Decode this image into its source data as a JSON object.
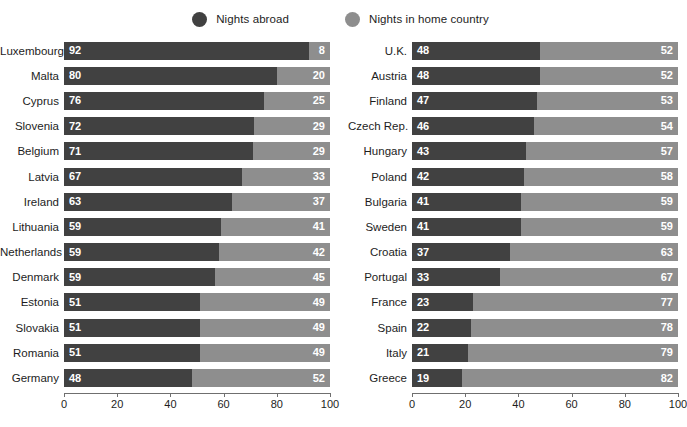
{
  "legend": {
    "items": [
      {
        "label": "Nights abroad",
        "color": "#414141",
        "icon": "legend-dot-icon"
      },
      {
        "label": "Nights in home country",
        "color": "#8e8e8e",
        "icon": "legend-dot-icon"
      }
    ]
  },
  "axis": {
    "ticks": [
      0,
      20,
      40,
      60,
      80,
      100
    ],
    "min": 0,
    "max": 100
  },
  "chart_data": {
    "type": "bar",
    "subtype": "stacked-horizontal-100pct",
    "title": "",
    "xlabel": "",
    "ylabel": "",
    "xlim": [
      0,
      100
    ],
    "grid": false,
    "legend_position": "top-center",
    "series": [
      {
        "name": "Nights abroad",
        "color": "#414141"
      },
      {
        "name": "Nights in home country",
        "color": "#8e8e8e"
      }
    ],
    "panels": [
      {
        "name": "left",
        "categories": [
          "Luxembourg",
          "Malta",
          "Cyprus",
          "Slovenia",
          "Belgium",
          "Latvia",
          "Ireland",
          "Lithuania",
          "Netherlands",
          "Denmark",
          "Estonia",
          "Slovakia",
          "Romania",
          "Germany"
        ],
        "rows": [
          {
            "label": "Luxembourg",
            "abroad": 92,
            "home": 8
          },
          {
            "label": "Malta",
            "abroad": 80,
            "home": 20
          },
          {
            "label": "Cyprus",
            "abroad": 76,
            "home": 25
          },
          {
            "label": "Slovenia",
            "abroad": 72,
            "home": 29
          },
          {
            "label": "Belgium",
            "abroad": 71,
            "home": 29
          },
          {
            "label": "Latvia",
            "abroad": 67,
            "home": 33
          },
          {
            "label": "Ireland",
            "abroad": 63,
            "home": 37
          },
          {
            "label": "Lithuania",
            "abroad": 59,
            "home": 41
          },
          {
            "label": "Netherlands",
            "abroad": 59,
            "home": 42
          },
          {
            "label": "Denmark",
            "abroad": 59,
            "home": 45
          },
          {
            "label": "Estonia",
            "abroad": 51,
            "home": 49
          },
          {
            "label": "Slovakia",
            "abroad": 51,
            "home": 49
          },
          {
            "label": "Romania",
            "abroad": 51,
            "home": 49
          },
          {
            "label": "Germany",
            "abroad": 48,
            "home": 52
          }
        ]
      },
      {
        "name": "right",
        "categories": [
          "U.K.",
          "Austria",
          "Finland",
          "Czech Rep.",
          "Hungary",
          "Poland",
          "Bulgaria",
          "Sweden",
          "Croatia",
          "Portugal",
          "France",
          "Spain",
          "Italy",
          "Greece"
        ],
        "rows": [
          {
            "label": "U.K.",
            "abroad": 48,
            "home": 52
          },
          {
            "label": "Austria",
            "abroad": 48,
            "home": 52
          },
          {
            "label": "Finland",
            "abroad": 47,
            "home": 53
          },
          {
            "label": "Czech Rep.",
            "abroad": 46,
            "home": 54
          },
          {
            "label": "Hungary",
            "abroad": 43,
            "home": 57
          },
          {
            "label": "Poland",
            "abroad": 42,
            "home": 58
          },
          {
            "label": "Bulgaria",
            "abroad": 41,
            "home": 59
          },
          {
            "label": "Sweden",
            "abroad": 41,
            "home": 59
          },
          {
            "label": "Croatia",
            "abroad": 37,
            "home": 63
          },
          {
            "label": "Portugal",
            "abroad": 33,
            "home": 67
          },
          {
            "label": "France",
            "abroad": 23,
            "home": 77
          },
          {
            "label": "Spain",
            "abroad": 22,
            "home": 78
          },
          {
            "label": "Italy",
            "abroad": 21,
            "home": 79
          },
          {
            "label": "Greece",
            "abroad": 19,
            "home": 82
          }
        ]
      }
    ]
  }
}
